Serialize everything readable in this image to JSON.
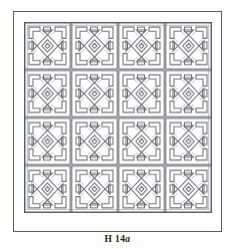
{
  "plate": {
    "caption_prefix": "H 14",
    "caption_suffix": "a",
    "caption_full": "H 14a",
    "figure_alt": "geometric fretwork lattice panel"
  },
  "colors": {
    "page_background": "#fdfdfb",
    "panel_background": "#ffffff",
    "frame_stroke": "#5b5f63",
    "pattern_stroke": "#6f7378",
    "pattern_stroke_light": "#9a9ea3",
    "caption_text": "#1d1d1d"
  },
  "frame": {
    "outer": {
      "x": 13,
      "y": 11,
      "width": 209,
      "height": 221,
      "stroke_width": 1
    },
    "panel": {
      "x": 24,
      "y": 22,
      "width": 188,
      "height": 191
    }
  },
  "pattern": {
    "name": "key-fret-and-diamond-lattice",
    "repeats_x": 4,
    "repeats_y": 4,
    "cell_size": 47,
    "line_width": 1.1,
    "motifs": [
      "corner-key-bracket",
      "small-square",
      "diamond-rosette",
      "lozenge-net"
    ]
  }
}
